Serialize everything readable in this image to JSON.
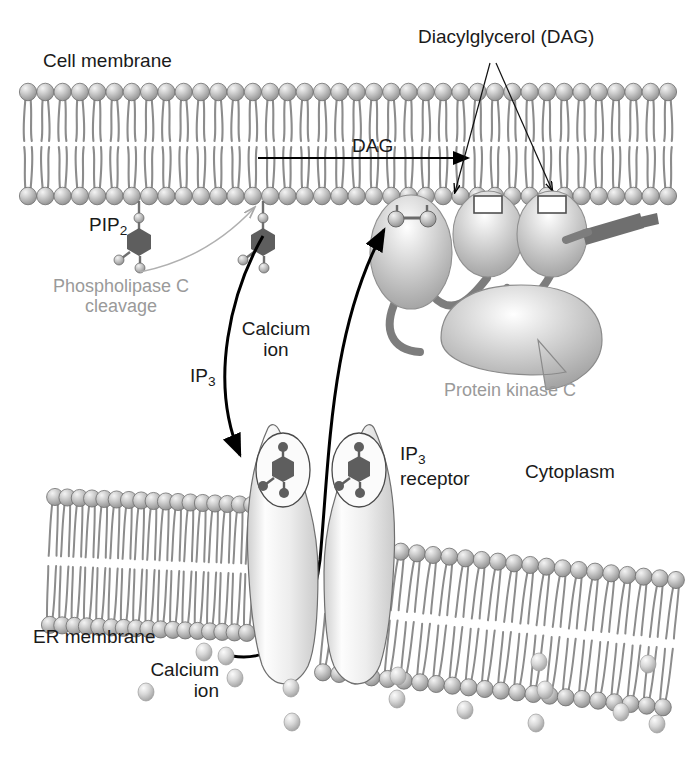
{
  "figure": {
    "type": "biological-diagram"
  },
  "labels": {
    "cell_membrane": "Cell membrane",
    "diacylglycerol": "Diacylglycerol (DAG)",
    "dag_flow": "DAG",
    "pip2": "PIP",
    "pip2_sub": "2",
    "phospholipase_c_cleavage": "Phospholipase C cleavage",
    "ip3": "IP",
    "ip3_sub": "3",
    "calcium_ion_upper": "Calcium ion",
    "protein_kinase_c": "Protein kinase C",
    "ip3_receptor": "IP",
    "ip3_receptor_sub": "3",
    "ip3_receptor_word": "receptor",
    "cytoplasm": "Cytoplasm",
    "er_membrane": "ER membrane",
    "calcium_ion_lower": "Calcium ion"
  },
  "colors": {
    "background": "#ffffff",
    "text": "#1a1a1a",
    "text_gray": "#9a9a9a",
    "lipid_head": "#9a9a9a",
    "lipid_head_light": "#e8e8e8",
    "lipid_tail": "#8c8c8c",
    "molecule_dark": "#5a5a5a",
    "protein_fill": "#bdbdbd",
    "protein_light": "#f2f2f2",
    "receptor_fill": "#e6e6e6",
    "linker_gray": "#808080",
    "rectangle_dark": "#707070",
    "arrow_black": "#000000",
    "outline": "#4d4d4d"
  },
  "components": {
    "cell_membrane_bilayer": {
      "head_count_per_leaflet": 38,
      "upper_leaflet_y": 92,
      "lower_leaflet_y": 196,
      "x_start": 28,
      "x_end": 668
    },
    "er_membrane_bilayer": {
      "orientation": "slanted",
      "left_segment_heads": 17,
      "right_segment_heads": 22
    },
    "pip2_molecules": [
      {
        "x": 139,
        "y": 196,
        "name": "pip2-labeled"
      },
      {
        "x": 263,
        "y": 196,
        "name": "pip2-cleaved"
      }
    ],
    "protein_kinase_c": {
      "lobes": 3,
      "lobe_centers": [
        [
          411,
          250
        ],
        [
          487,
          232
        ],
        [
          551,
          232
        ]
      ],
      "catalytic_domain_center": [
        521,
        337
      ],
      "membrane_anchor_rect": [
        604,
        222
      ]
    },
    "ip3_receptor": {
      "lobe_centers": [
        [
          284,
          540
        ],
        [
          357,
          540
        ]
      ],
      "bound_ip3_sites": 2
    },
    "calcium_ions_lower": [
      [
        204,
        652
      ],
      [
        146,
        692
      ],
      [
        291,
        688
      ],
      [
        397,
        699
      ],
      [
        398,
        676
      ],
      [
        539,
        662
      ],
      [
        536,
        723
      ],
      [
        657,
        724
      ],
      [
        545,
        690
      ],
      [
        621,
        712
      ],
      [
        235,
        678
      ],
      [
        465,
        710
      ],
      [
        648,
        664
      ],
      [
        292,
        722
      ]
    ],
    "arrows": {
      "dag_flow": {
        "from": [
          258,
          158
        ],
        "to": [
          476,
          158
        ],
        "style": "straight-black"
      },
      "dag_pointer_left": {
        "from": [
          487,
          70
        ],
        "to": [
          455,
          190
        ],
        "style": "thin-black"
      },
      "dag_pointer_right": {
        "from": [
          497,
          70
        ],
        "to": [
          551,
          190
        ],
        "style": "thin-black"
      },
      "plc_pointer": {
        "from": [
          185,
          272
        ],
        "to": [
          253,
          205
        ],
        "style": "thin-gray-curved"
      },
      "ip3_to_receptor": {
        "from": [
          262,
          233
        ],
        "to": [
          243,
          463
        ],
        "style": "thick-black-curved"
      },
      "calcium_to_pkc": {
        "from": [
          232,
          656
        ],
        "to": [
          383,
          222
        ],
        "style": "thick-black-curved"
      }
    }
  }
}
